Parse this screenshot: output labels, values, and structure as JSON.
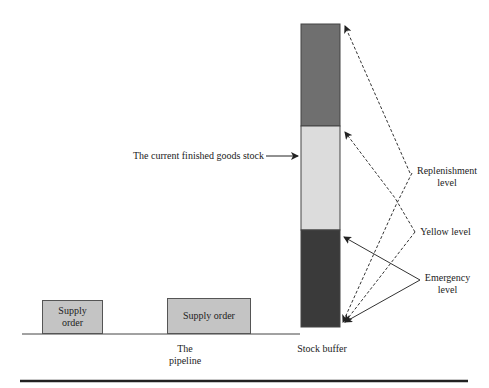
{
  "diagram": {
    "supply_order_1": "Supply\norder",
    "supply_order_2": "Supply order",
    "pipeline_label_line1": "The",
    "pipeline_label_line2": "pipeline",
    "stock_buffer_label": "Stock buffer",
    "current_stock_label": "The current finished goods stock",
    "replenishment_line1": "Replenishment",
    "replenishment_line2": "level",
    "yellow_level": "Yellow level",
    "emergency_line1": "Emergency",
    "emergency_line2": "level",
    "colors": {
      "top_zone": "#6f6f6f",
      "middle_zone": "#dcdcdc",
      "bottom_zone": "#3a3a3a",
      "supply_box": "#c4c4c4"
    }
  }
}
